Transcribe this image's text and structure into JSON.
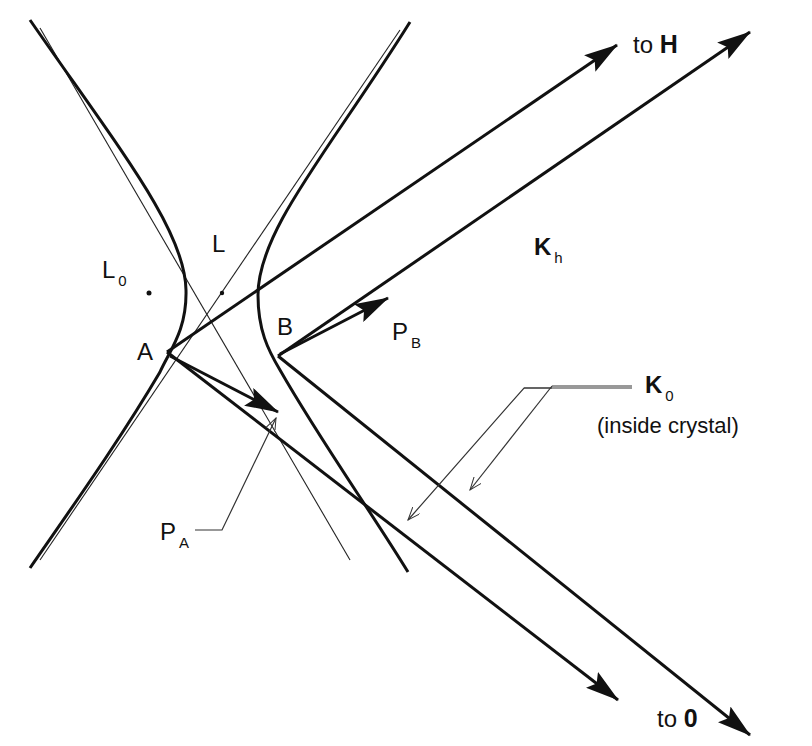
{
  "diagram": {
    "points": {
      "A": "A",
      "B": "B",
      "L": "L",
      "L0_main": "L",
      "L0_sub": "0"
    },
    "vectors": {
      "PA_main": "P",
      "PA_sub": "A",
      "PB_main": "P",
      "PB_sub": "B",
      "Kh_main": "K",
      "Kh_sub": "h",
      "K0_main": "K",
      "K0_sub": "0",
      "K0_note": "(inside crystal)"
    },
    "directions": {
      "to_H_prefix": "to ",
      "to_H_label": "H",
      "to_O_prefix": "to ",
      "to_O_label": "0"
    },
    "colors": {
      "stroke": "#111111",
      "leader": "#333333",
      "background": "#ffffff"
    }
  }
}
